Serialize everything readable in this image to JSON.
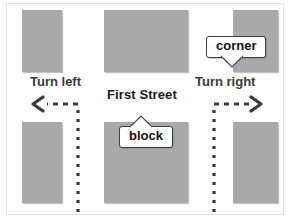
{
  "figure": {
    "type": "street-map-diagram",
    "colors": {
      "block_fill": "#a9a9a9",
      "background": "#ffffff",
      "text": "#1b1b1b",
      "turn_text": "#3a3a3a",
      "arrow": "#3a3a3a",
      "callout_border": "#3f3f3f"
    }
  },
  "street": {
    "name": "First Street"
  },
  "turns": {
    "left": {
      "label": "Turn left",
      "arrow_direction": "left",
      "arrow_style": "dashed"
    },
    "right": {
      "label": "Turn right",
      "arrow_direction": "right",
      "arrow_style": "dashed"
    }
  },
  "callouts": [
    {
      "id": "corner",
      "label": "corner",
      "tail_direction": "down"
    },
    {
      "id": "block",
      "label": "block",
      "tail_direction": "up"
    }
  ],
  "blocks": [
    {
      "id": "block-top-left",
      "row": "top",
      "column": "left"
    },
    {
      "id": "block-top-mid",
      "row": "top",
      "column": "middle"
    },
    {
      "id": "block-top-right",
      "row": "top",
      "column": "right"
    },
    {
      "id": "block-bottom-left",
      "row": "bottom",
      "column": "left"
    },
    {
      "id": "block-bottom-mid",
      "row": "bottom",
      "column": "middle"
    },
    {
      "id": "block-bottom-right",
      "row": "bottom",
      "column": "right"
    }
  ]
}
